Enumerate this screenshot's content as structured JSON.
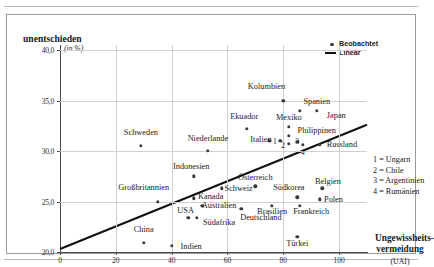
{
  "chart_data": {
    "type": "scatter",
    "title": "",
    "ylabel": "unentschieden",
    "yunit": "(in %)",
    "xlabel": "Ungewissheits-vermeidung",
    "xlabel_line1": "Ungewissheits-",
    "xlabel_line2": "vermeidung",
    "xlabel_sub": "(UAI)",
    "xlim": [
      0,
      110
    ],
    "ylim": [
      20.0,
      40.5
    ],
    "xticks": [
      0,
      20,
      40,
      60,
      80,
      100
    ],
    "xticklabels": [
      "0",
      "20",
      "40",
      "60",
      "80",
      "100"
    ],
    "yticks": [
      20.0,
      25.0,
      30.0,
      35.0,
      40.0
    ],
    "yticklabels": [
      "20,0",
      "25,0",
      "30,0",
      "35,0",
      "40,0"
    ],
    "grid": true,
    "legend_position": "top-right",
    "legend": [
      {
        "label": "Beobachtet",
        "marker": "dot"
      },
      {
        "label": "Linear",
        "marker": "line"
      }
    ],
    "trendline": {
      "name": "Linear",
      "x0": 0,
      "y0": 20.3,
      "x1": 110,
      "y1": 32.6
    },
    "points": [
      {
        "label": "Schweden",
        "x": 29,
        "y": 30.5,
        "lx": 29,
        "ly": 31.9
      },
      {
        "label": "Niederlande",
        "x": 53,
        "y": 30.0,
        "lx": 53,
        "ly": 31.3
      },
      {
        "label": "Kolumbien",
        "x": 80,
        "y": 35.0,
        "lx": 74,
        "ly": 36.4
      },
      {
        "label": "Spanien",
        "x": 86,
        "y": 34.0,
        "lx": 92,
        "ly": 35.0
      },
      {
        "label": "Japan",
        "x": 92,
        "y": 34.0,
        "lx": 99,
        "ly": 33.6
      },
      {
        "label": "Ekuador",
        "x": 67,
        "y": 32.2,
        "lx": 66,
        "ly": 33.5
      },
      {
        "label": "Mexiko",
        "x": 82,
        "y": 32.4,
        "lx": 82,
        "ly": 33.4
      },
      {
        "label": "Philippinen",
        "x": 82,
        "y": 31.5,
        "lx": 92,
        "ly": 32.1
      },
      {
        "label": "Italien",
        "x": 75,
        "y": 31.0,
        "lx": 72,
        "ly": 31.2
      },
      {
        "label": "Russland",
        "x": 93,
        "y": 30.6,
        "lx": 101,
        "ly": 30.7
      },
      {
        "label": "Indonesien",
        "x": 48,
        "y": 27.5,
        "lx": 47,
        "ly": 28.5
      },
      {
        "label": "Großbritannien",
        "x": 35,
        "y": 25.0,
        "lx": 30,
        "ly": 26.4
      },
      {
        "label": "Kanada",
        "x": 48,
        "y": 25.3,
        "lx": 54,
        "ly": 25.5
      },
      {
        "label": "Österreich",
        "x": 70,
        "y": 26.5,
        "lx": 70,
        "ly": 27.4
      },
      {
        "label": "Schweiz",
        "x": 58,
        "y": 26.3,
        "lx": 64,
        "ly": 26.3
      },
      {
        "label": "Australien",
        "x": 51,
        "y": 24.6,
        "lx": 57,
        "ly": 24.7
      },
      {
        "label": "USA",
        "x": 46,
        "y": 23.4,
        "lx": 45,
        "ly": 24.2
      },
      {
        "label": "Südafrika",
        "x": 49,
        "y": 23.4,
        "lx": 57,
        "ly": 23.0
      },
      {
        "label": "China",
        "x": 30,
        "y": 20.9,
        "lx": 30,
        "ly": 22.3
      },
      {
        "label": "Indien",
        "x": 40,
        "y": 20.6,
        "lx": 47,
        "ly": 20.6
      },
      {
        "label": "Südkorea",
        "x": 85,
        "y": 25.4,
        "lx": 82,
        "ly": 26.4
      },
      {
        "label": "Belgien",
        "x": 94,
        "y": 26.3,
        "lx": 96,
        "ly": 27.0
      },
      {
        "label": "Polen",
        "x": 93,
        "y": 25.2,
        "lx": 98,
        "ly": 25.2
      },
      {
        "label": "Frankreich",
        "x": 86,
        "y": 24.6,
        "lx": 90,
        "ly": 24.1
      },
      {
        "label": "Brasilien",
        "x": 76,
        "y": 24.6,
        "lx": 76,
        "ly": 24.1
      },
      {
        "label": "Deutschland",
        "x": 65,
        "y": 24.3,
        "lx": 72,
        "ly": 23.5
      },
      {
        "label": "Türkei",
        "x": 85,
        "y": 21.5,
        "lx": 85,
        "ly": 20.9
      }
    ],
    "numbered_points": [
      {
        "n": "1",
        "x": 79,
        "y": 31.0,
        "lx": 77,
        "ly": 31.0
      },
      {
        "n": "2",
        "x": 82,
        "y": 30.7,
        "lx": 80,
        "ly": 30.6
      },
      {
        "n": "3",
        "x": 85,
        "y": 30.9,
        "lx": 85,
        "ly": 31.0
      },
      {
        "n": "4",
        "x": 87,
        "y": 30.6,
        "lx": 87,
        "ly": 29.9
      }
    ],
    "notes": [
      "1 = Ungarn",
      "2 = Chile",
      "3 = Argentinien",
      "4 = Rumänien"
    ]
  }
}
